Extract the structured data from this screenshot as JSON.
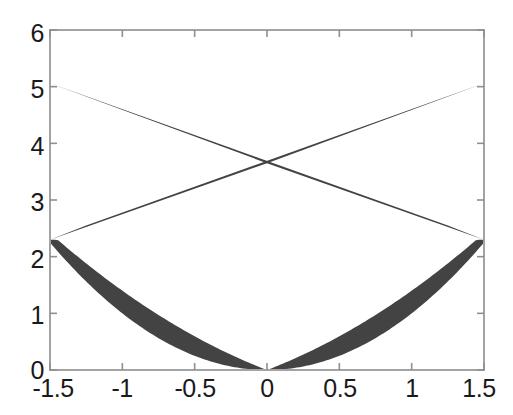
{
  "chart_data": {
    "type": "area",
    "title": "",
    "xlabel": "",
    "ylabel": "",
    "xlim": [
      -1.5,
      1.5
    ],
    "ylim": [
      0,
      6
    ],
    "grid": false,
    "legend": null,
    "fill_color": "#434343",
    "axis_color": "#a0a0a0",
    "background": "#ffffff",
    "xticks": [
      "-1.5",
      "-1",
      "-0.5",
      "0",
      "0.5",
      "1",
      "1.5"
    ],
    "xtick_values": [
      -1.5,
      -1,
      -0.5,
      0,
      0.5,
      1,
      1.5
    ],
    "yticks": [
      "0",
      "1",
      "2",
      "3",
      "4",
      "5",
      "6"
    ],
    "ytick_values": [
      0,
      1,
      2,
      3,
      4,
      5,
      6
    ],
    "series": [
      {
        "name": "parabola-band",
        "description": "Shaded band between the parabola y = x^2 and the chord line from (-1.5, 2.3) through (0, 0) shape to (1.5, 2.3)",
        "x": [
          -1.5,
          -1.25,
          -1.0,
          -0.75,
          -0.5,
          -0.25,
          0,
          0.25,
          0.5,
          0.75,
          1.0,
          1.25,
          1.5
        ],
        "lower": [
          2.25,
          1.5625,
          1.0,
          0.5625,
          0.25,
          0.0625,
          0.0,
          0.0625,
          0.25,
          0.5625,
          1.0,
          1.5625,
          2.25
        ],
        "upper": [
          2.3,
          1.74,
          1.24,
          0.83,
          0.5,
          0.25,
          0.0,
          0.25,
          0.5,
          0.83,
          1.24,
          1.74,
          2.3
        ]
      },
      {
        "name": "upper-crossing-band-left",
        "description": "Dark triangle with vertices at (-1.5, 5.06), (0, 3.65), (1.5, 2.30) plus closure toward (1.25, 2.55)",
        "vertices": [
          [
            -1.5,
            5.06
          ],
          [
            0.0,
            3.65
          ],
          [
            1.5,
            2.3
          ],
          [
            1.25,
            2.55
          ]
        ]
      },
      {
        "name": "upper-crossing-band-right",
        "description": "Dark triangle mirrored: vertices at (1.5, 5.06), (0, 3.65), (-1.5, 2.30), (-1.25, 2.55)",
        "vertices": [
          [
            1.5,
            5.06
          ],
          [
            0.0,
            3.65
          ],
          [
            -1.5,
            2.3
          ],
          [
            -1.25,
            2.55
          ]
        ]
      }
    ],
    "annotations": {
      "crossing_point_x": 0,
      "crossing_point_y": 3.65,
      "left_edge_upper_y": 5.06,
      "left_edge_lower_y": 2.3,
      "right_edge_upper_y": 5.06,
      "right_edge_lower_y": 2.3,
      "parabola_vertex": [
        0,
        0
      ]
    }
  },
  "axes": {
    "left_px": 50,
    "right_px": 484,
    "top_px": 30,
    "bottom_px": 370
  }
}
